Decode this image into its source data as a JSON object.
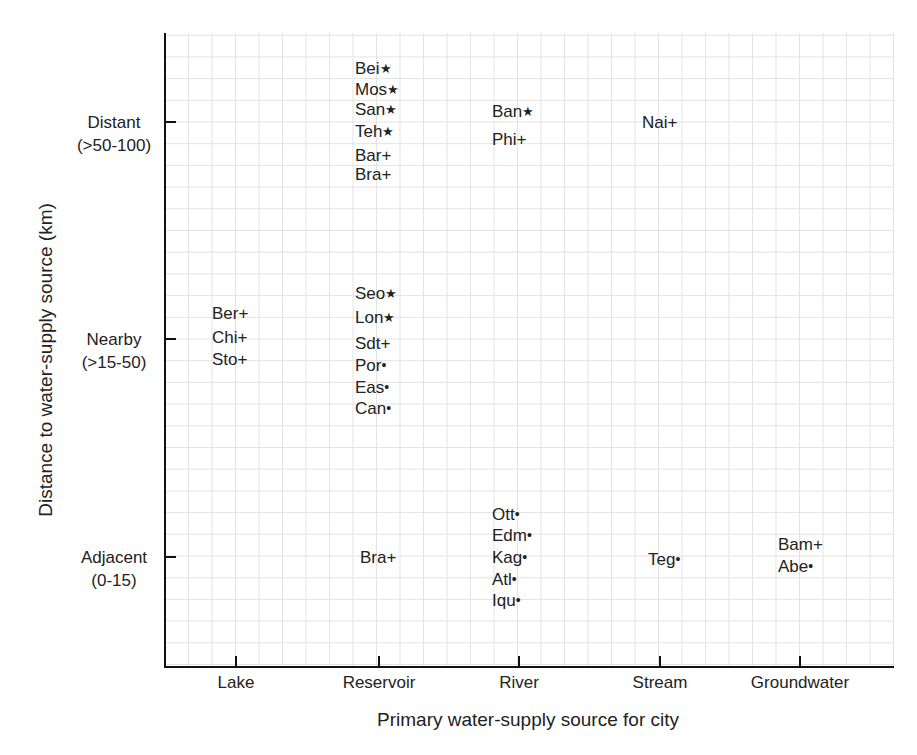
{
  "chart_data": {
    "type": "scatter",
    "title": "",
    "xlabel": "Primary water-supply source for city",
    "ylabel": "Distance to water-supply source (km)",
    "categories": [
      "Lake",
      "Reservoir",
      "River",
      "Stream",
      "Groundwater"
    ],
    "y_levels": [
      {
        "name": "Distant",
        "range": "(>50-100)"
      },
      {
        "name": "Nearby",
        "range": "(>15-50)"
      },
      {
        "name": "Adjacent",
        "range": "(0-15)"
      }
    ],
    "grid": true,
    "legend": null,
    "markers": {
      "star": "★",
      "plus": "+",
      "dot": "•"
    },
    "points": [
      {
        "label": "Bei",
        "marker": "star",
        "x": "Reservoir",
        "y": "Distant",
        "row": 0,
        "dy": -2.5
      },
      {
        "label": "Mos",
        "marker": "star",
        "x": "Reservoir",
        "y": "Distant",
        "row": 1,
        "dy": -1.5
      },
      {
        "label": "San",
        "marker": "star",
        "x": "Reservoir",
        "y": "Distant",
        "row": 2,
        "dy": -0.6
      },
      {
        "label": "Teh",
        "marker": "star",
        "x": "Reservoir",
        "y": "Distant",
        "row": 3,
        "dy": 0.4
      },
      {
        "label": "Bar",
        "marker": "plus",
        "x": "Reservoir",
        "y": "Distant",
        "row": 4,
        "dy": 1.5
      },
      {
        "label": "Bra",
        "marker": "plus",
        "x": "Reservoir",
        "y": "Distant",
        "row": 5,
        "dy": 2.4
      },
      {
        "label": "Ban",
        "marker": "star",
        "x": "River",
        "y": "Distant",
        "dy": -0.5
      },
      {
        "label": "Phi",
        "marker": "plus",
        "x": "River",
        "y": "Distant",
        "dy": 0.8
      },
      {
        "label": "Nai",
        "marker": "plus",
        "x": "Stream",
        "y": "Distant",
        "dy": 0.0
      },
      {
        "label": "Ber",
        "marker": "plus",
        "x": "Lake",
        "y": "Nearby",
        "dy": -1.2
      },
      {
        "label": "Chi",
        "marker": "plus",
        "x": "Lake",
        "y": "Nearby",
        "dy": -0.1
      },
      {
        "label": "Sto",
        "marker": "plus",
        "x": "Lake",
        "y": "Nearby",
        "dy": 0.9
      },
      {
        "label": "Seo",
        "marker": "star",
        "x": "Reservoir",
        "y": "Nearby",
        "dy": -2.1
      },
      {
        "label": "Lon",
        "marker": "star",
        "x": "Reservoir",
        "y": "Nearby",
        "dy": -1.0
      },
      {
        "label": "Sdt",
        "marker": "plus",
        "x": "Reservoir",
        "y": "Nearby",
        "dy": 0.2
      },
      {
        "label": "Por",
        "marker": "dot",
        "x": "Reservoir",
        "y": "Nearby",
        "dy": 1.2
      },
      {
        "label": "Eas",
        "marker": "dot",
        "x": "Reservoir",
        "y": "Nearby",
        "dy": 2.2
      },
      {
        "label": "Can",
        "marker": "dot",
        "x": "Reservoir",
        "y": "Nearby",
        "dy": 3.2
      },
      {
        "label": "Bra",
        "marker": "plus",
        "x": "Reservoir",
        "y": "Adjacent",
        "dy": 0.0
      },
      {
        "label": "Ott",
        "marker": "dot",
        "x": "River",
        "y": "Adjacent",
        "dy": -2.0
      },
      {
        "label": "Edm",
        "marker": "dot",
        "x": "River",
        "y": "Adjacent",
        "dy": -1.0
      },
      {
        "label": "Kag",
        "marker": "dot",
        "x": "River",
        "y": "Adjacent",
        "dy": 0.0
      },
      {
        "label": "Atl",
        "marker": "dot",
        "x": "River",
        "y": "Adjacent",
        "dy": 1.0
      },
      {
        "label": "Iqu",
        "marker": "dot",
        "x": "River",
        "y": "Adjacent",
        "dy": 2.0
      },
      {
        "label": "Teg",
        "marker": "dot",
        "x": "Stream",
        "y": "Adjacent",
        "dy": 0.1
      },
      {
        "label": "Bam",
        "marker": "plus",
        "x": "Groundwater",
        "y": "Adjacent",
        "dy": -0.6
      },
      {
        "label": "Abe",
        "marker": "dot",
        "x": "Groundwater",
        "y": "Adjacent",
        "dy": 0.4
      }
    ]
  }
}
